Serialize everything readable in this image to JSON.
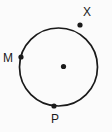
{
  "figure": {
    "type": "geometry-circle-diagram",
    "canvas": {
      "width": 112,
      "height": 132,
      "background": "#fbfbfb"
    },
    "colors": {
      "stroke": "#1a1a1a",
      "point_fill": "#1a1a1a",
      "label_color": "#1a1a1a",
      "background": "#fbfbfb"
    },
    "circle": {
      "center_x": 58.5,
      "center_y": 67,
      "radius": 39,
      "stroke_width": 1.7,
      "fill": "none"
    },
    "center_point": {
      "name": "center-dot",
      "label": "",
      "cx": 63.5,
      "cy": 66.5,
      "r": 2.6
    },
    "points": [
      {
        "id": "X",
        "label": "X",
        "cx": 80,
        "cy": 25,
        "r": 2.6,
        "label_x": 83,
        "label_y": 6
      },
      {
        "id": "M",
        "label": "M",
        "cx": 21,
        "cy": 57,
        "r": 2.6,
        "label_x": 3,
        "label_y": 52
      },
      {
        "id": "P",
        "label": "P",
        "cx": 54,
        "cy": 106,
        "r": 2.6,
        "label_x": 51,
        "label_y": 113
      }
    ]
  }
}
